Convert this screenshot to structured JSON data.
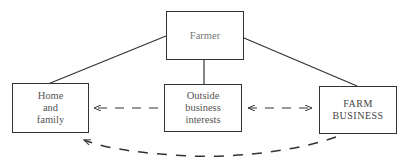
{
  "diagram": {
    "nodes": {
      "farmer": {
        "lines": [
          "Farmer"
        ]
      },
      "home": {
        "lines": [
          "Home",
          "and",
          "family"
        ]
      },
      "outside": {
        "lines": [
          "Outside",
          "business",
          "interests"
        ]
      },
      "farm": {
        "lines": [
          "FARM",
          "BUSINESS"
        ]
      }
    },
    "edges": [
      {
        "from": "Farmer",
        "to": "Home and family",
        "style": "solid"
      },
      {
        "from": "Farmer",
        "to": "Outside business interests",
        "style": "solid"
      },
      {
        "from": "Farmer",
        "to": "FARM BUSINESS",
        "style": "solid"
      },
      {
        "from": "Outside business interests",
        "to": "Home and family",
        "style": "dashed-arrow"
      },
      {
        "from": "Outside business interests",
        "to": "FARM BUSINESS",
        "style": "dashed-double-arrow"
      },
      {
        "from": "FARM BUSINESS",
        "to": "Home and family",
        "style": "dashed-curved-arrow"
      }
    ],
    "colors": {
      "line": "#333333",
      "text": "#555555",
      "background": "#ffffff"
    }
  }
}
